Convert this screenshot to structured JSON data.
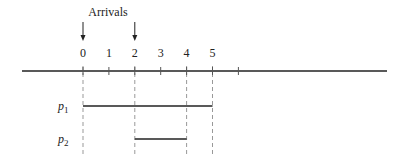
{
  "title": "Arrivals",
  "axis": {
    "origin_x": 83,
    "unit_px": 25.9,
    "y": 71,
    "x_start": 22,
    "x_end": 387,
    "ticks": [
      0,
      1,
      2,
      3,
      4,
      5,
      6
    ],
    "tick_labels": [
      "0",
      "1",
      "2",
      "3",
      "4",
      "5"
    ]
  },
  "arrivals": [
    0,
    2
  ],
  "jobs": [
    {
      "label": "p",
      "subscript": "1",
      "start": 0,
      "end": 5,
      "y": 106
    },
    {
      "label": "p",
      "subscript": "2",
      "start": 2,
      "end": 4,
      "y": 139
    }
  ],
  "dashed_guides_at": [
    0,
    2,
    4,
    5
  ],
  "colors": {
    "line": "#222222",
    "dash": "#999999",
    "text": "#222222"
  }
}
